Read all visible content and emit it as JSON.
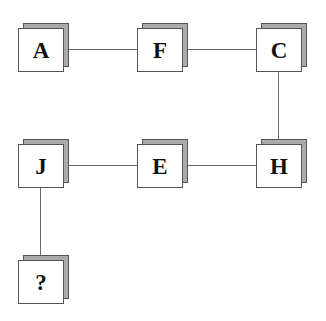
{
  "diagram": {
    "type": "node-link puzzle",
    "colors": {
      "face": "#ffffff",
      "shadow": "#ababab",
      "border": "#555555",
      "line": "#6a6a6a",
      "text": "#111111"
    },
    "nodes": [
      {
        "id": "A",
        "label": "A",
        "row": 1,
        "col": 1
      },
      {
        "id": "F",
        "label": "F",
        "row": 1,
        "col": 2
      },
      {
        "id": "C",
        "label": "C",
        "row": 1,
        "col": 3
      },
      {
        "id": "J",
        "label": "J",
        "row": 2,
        "col": 1
      },
      {
        "id": "E",
        "label": "E",
        "row": 2,
        "col": 2
      },
      {
        "id": "H",
        "label": "H",
        "row": 2,
        "col": 3
      },
      {
        "id": "Q",
        "label": "?",
        "row": 3,
        "col": 1
      }
    ],
    "edges": [
      {
        "from": "A",
        "to": "F"
      },
      {
        "from": "F",
        "to": "C"
      },
      {
        "from": "C",
        "to": "H"
      },
      {
        "from": "H",
        "to": "E"
      },
      {
        "from": "E",
        "to": "J"
      },
      {
        "from": "J",
        "to": "?"
      }
    ]
  }
}
